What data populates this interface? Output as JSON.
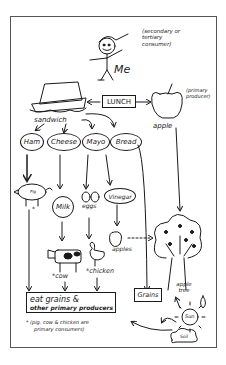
{
  "diagram": {
    "top": {
      "person_label": "Me",
      "person_note": "(secondary or tertiary consumer)",
      "center_label": "LUNCH",
      "apple_label": "apple",
      "apple_note": "(primary producer)",
      "sandwich_label": "sandwich"
    },
    "ingredients": [
      {
        "label": "Ham"
      },
      {
        "label": "Cheese"
      },
      {
        "label": "Mayo"
      },
      {
        "label": "Bread"
      }
    ],
    "sources": {
      "pig_label": "Pig",
      "pig_star": "*",
      "milk_label": "Milk",
      "eggs_label": "eggs",
      "vinegar_label": "Vinegar",
      "apples_label": "apples",
      "cow_label": "*cow",
      "chicken_label": "*chicken",
      "apple_tree_label": "apple tree",
      "grains_label": "Grains",
      "sun_label": "Sun",
      "soil_label": "Soil"
    },
    "bottom": {
      "producers_box_line1": "eat grains &",
      "producers_box_line2": "other primary producers",
      "footnote_line1": "* (pig, cow & chicken are",
      "footnote_line2": "primary consumers)"
    }
  }
}
